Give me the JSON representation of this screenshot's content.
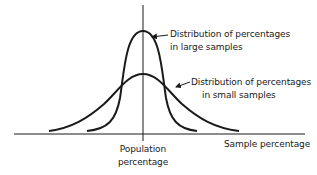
{
  "diagram": {
    "type": "sampling-distribution-comparison",
    "x_axis_label": "Sample percentage",
    "center_label_line1": "Population",
    "center_label_line2": "percentage",
    "curves": [
      {
        "name": "large-samples",
        "label_line1": "Distribution of percentages",
        "label_line2": "in large samples",
        "shape": "tall-narrow"
      },
      {
        "name": "small-samples",
        "label_line1": "Distribution of percentages",
        "label_line2": "in small samples",
        "shape": "short-wide"
      }
    ],
    "colors": {
      "stroke": "#1a1a1a",
      "background": "#ffffff"
    }
  }
}
